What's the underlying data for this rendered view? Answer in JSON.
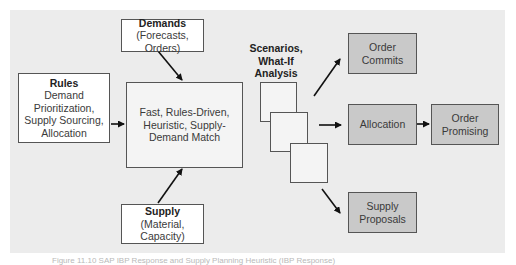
{
  "diagram": {
    "rules": {
      "title": "Rules",
      "lines": [
        "Demand",
        "Prioritization,",
        "Supply Sourcing,",
        "Allocation"
      ]
    },
    "demands": {
      "title": "Demands",
      "lines": [
        "(Forecasts,",
        "Orders)"
      ]
    },
    "supply": {
      "title": "Supply",
      "lines": [
        "(Material, Capacity)"
      ]
    },
    "engine": {
      "lines": [
        "Fast, Rules-Driven,",
        "Heuristic, Supply-",
        "Demand Match"
      ]
    },
    "scenarios": {
      "lines": [
        "Scenarios,",
        "What-If",
        "Analysis"
      ]
    },
    "outputs": {
      "order_commits": {
        "lines": [
          "Order",
          "Commits"
        ]
      },
      "allocation": {
        "lines": [
          "Allocation"
        ]
      },
      "order_promising": {
        "lines": [
          "Order",
          "Promising"
        ]
      },
      "supply_proposals": {
        "lines": [
          "Supply",
          "Proposals"
        ]
      }
    },
    "colors": {
      "panel": "#ececec",
      "output_box": "#c9c9c9",
      "input_box": "#ffffff",
      "border": "#555555"
    }
  },
  "caption": "Figure 11.10  SAP IBP Response and Supply Planning Heuristic (IBP Response)"
}
